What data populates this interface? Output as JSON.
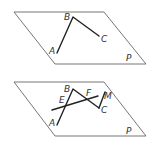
{
  "figures": [
    {
      "name": "figure-top",
      "plane_label": "P",
      "points": {
        "A": "A",
        "B": "B",
        "C": "C"
      }
    },
    {
      "name": "figure-bottom",
      "plane_label": "P",
      "points": {
        "A": "A",
        "B": "B",
        "C": "C",
        "E": "E",
        "F": "F",
        "M": "M"
      }
    }
  ],
  "colors": {
    "plane_stroke": "#666666",
    "segment_stroke": "#222222",
    "label": "#333333",
    "background": "#ffffff"
  }
}
